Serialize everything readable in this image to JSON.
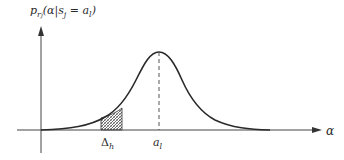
{
  "diagram": {
    "type": "probability-density",
    "y_axis_label": {
      "base": "p",
      "sub": "r",
      "subsub": "j",
      "argument": "(α|s",
      "arg_sub": "j",
      "rest": " = a",
      "rest_sub": "l",
      "close": ")"
    },
    "x_axis_label": "α",
    "peak_label": {
      "base": "a",
      "sub": "l"
    },
    "interval_label": {
      "base": "Δ",
      "sub": "h"
    },
    "colors": {
      "stroke": "#2a2a2a",
      "dashed": "#555555",
      "hatch": "#555555"
    }
  }
}
